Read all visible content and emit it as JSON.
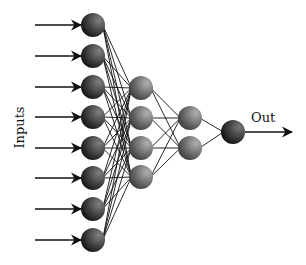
{
  "diagram": {
    "type": "feedforward-neural-network",
    "inputs_label": "Inputs",
    "output_label": "Out",
    "layers": [
      {
        "name": "input",
        "x": 93,
        "nodes_y": [
          25,
          56,
          87,
          117,
          148,
          178,
          209,
          240
        ]
      },
      {
        "name": "hidden-1",
        "x": 141,
        "nodes_y": [
          88,
          118,
          148,
          177
        ]
      },
      {
        "name": "hidden-2",
        "x": 190,
        "nodes_y": [
          118,
          148
        ]
      },
      {
        "name": "output",
        "x": 233,
        "nodes_y": [
          132
        ]
      }
    ],
    "node_radius": 12,
    "input_arrow_start_x": 35,
    "output_arrow_end_x": 292,
    "colors": {
      "input_node_dark": "#1a1a1a",
      "input_node_light": "#7a7a7a",
      "hidden_node_dark": "#4a4a4a",
      "hidden_node_light": "#a8a8a8",
      "edge": "#111111"
    }
  }
}
